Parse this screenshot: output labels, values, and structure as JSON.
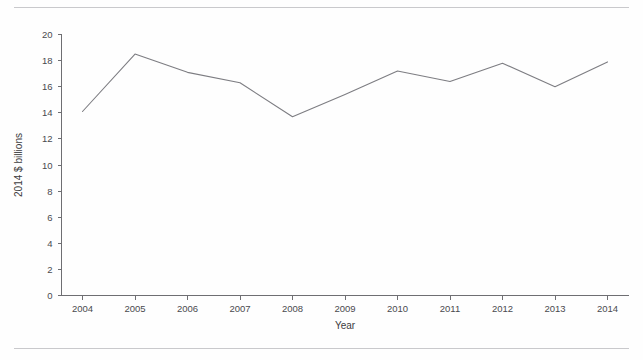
{
  "figure": {
    "background_color": "#fefefe",
    "rule_color": "#c9c9cc",
    "line_color": "#7d7d82",
    "axis_color": "#6e6e72"
  },
  "chart_data": {
    "type": "line",
    "title": "",
    "subtitle": "",
    "xlabel": "Year",
    "ylabel": "2014 $ billions",
    "categories": [
      "2004",
      "2005",
      "2006",
      "2007",
      "2008",
      "2009",
      "2010",
      "2011",
      "2012",
      "2013",
      "2014"
    ],
    "x": [
      2004,
      2005,
      2006,
      2007,
      2008,
      2009,
      2010,
      2011,
      2012,
      2013,
      2014
    ],
    "values": [
      14.1,
      18.5,
      17.1,
      16.3,
      13.7,
      15.4,
      17.2,
      16.4,
      17.8,
      16.0,
      17.9
    ],
    "series": [
      {
        "name": "2014 $ billions",
        "values": [
          14.1,
          18.5,
          17.1,
          16.3,
          13.7,
          15.4,
          17.2,
          16.4,
          17.8,
          16.0,
          17.9
        ]
      }
    ],
    "ylim": [
      0,
      20
    ],
    "xlim": [
      2003.6,
      2014.4
    ],
    "yticks": [
      0,
      2,
      4,
      6,
      8,
      10,
      12,
      14,
      16,
      18,
      20
    ],
    "ytick_labels": [
      "0",
      "2",
      "4",
      "6",
      "8",
      "10",
      "12",
      "14",
      "16",
      "18",
      "20"
    ],
    "xtick_labels": [
      "2004",
      "2005",
      "2006",
      "2007",
      "2008",
      "2009",
      "2010",
      "2011",
      "2012",
      "2013",
      "2014"
    ],
    "grid": false,
    "legend": false,
    "legend_position": "none",
    "marker": "none",
    "annotations": []
  }
}
